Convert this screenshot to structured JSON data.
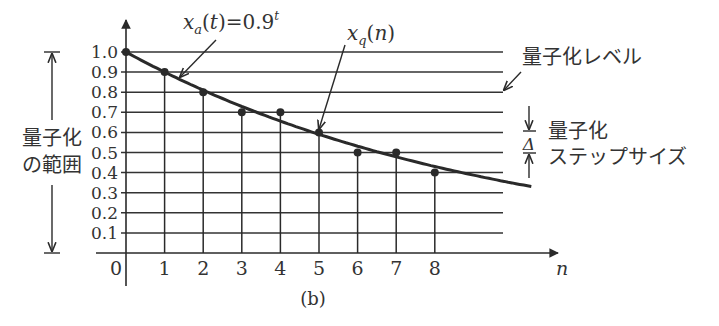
{
  "chart_data": {
    "type": "line",
    "title": "",
    "caption": "(b)",
    "xlabel": "n",
    "ylabel": "",
    "x_ticks": [
      "0",
      "1",
      "2",
      "3",
      "4",
      "5",
      "6",
      "7",
      "8"
    ],
    "y_ticks": [
      "0.1",
      "0.2",
      "0.3",
      "0.4",
      "0.5",
      "0.6",
      "0.7",
      "0.8",
      "0.9",
      "1.0"
    ],
    "xlim": [
      0,
      11
    ],
    "ylim": [
      0,
      1.0
    ],
    "grid": "horizontal quantization levels at every 0.1",
    "series": [
      {
        "name": "x_a(t)=0.9^t",
        "kind": "continuous curve",
        "x": [
          0,
          1,
          2,
          3,
          4,
          5,
          6,
          7,
          8,
          9,
          10.5
        ],
        "values": [
          1.0,
          0.9,
          0.81,
          0.729,
          0.656,
          0.59,
          0.531,
          0.478,
          0.43,
          0.387,
          0.33
        ]
      },
      {
        "name": "x_q(n)",
        "kind": "stem (quantized samples)",
        "x": [
          0,
          1,
          2,
          3,
          4,
          5,
          6,
          7,
          8
        ],
        "values": [
          1.0,
          0.9,
          0.8,
          0.7,
          0.7,
          0.6,
          0.5,
          0.5,
          0.4
        ]
      }
    ],
    "annotations": {
      "curve_label": "x_a(t)=0.9^t",
      "sample_label": "x_q(n)",
      "quant_level_label": "量子化レベル",
      "range_label_line1": "量子化",
      "range_label_line2": "の範囲",
      "step_label_line1": "量子化",
      "step_label_line2": "ステップサイズ",
      "step_symbol": "Δ"
    }
  }
}
